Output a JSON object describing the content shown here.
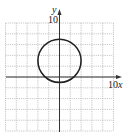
{
  "chart_data": {
    "type": "line",
    "title": "",
    "xlabel": "x",
    "ylabel": "y",
    "xlim": [
      -10,
      10
    ],
    "ylim": [
      -10,
      10
    ],
    "grid": true,
    "grid_step": 2,
    "tick_labels": {
      "x": [
        "10"
      ],
      "y": [
        "10"
      ]
    },
    "series": [
      {
        "name": "circle",
        "shape": "circle",
        "center": [
          0,
          3
        ],
        "radius": 4,
        "color": "#222222"
      }
    ]
  },
  "labels": {
    "x_axis": "x",
    "y_axis": "y",
    "x_tick": "10",
    "y_tick": "10"
  },
  "colors": {
    "grid": "#b8b8b8",
    "axis": "#333333",
    "curve": "#222222"
  }
}
